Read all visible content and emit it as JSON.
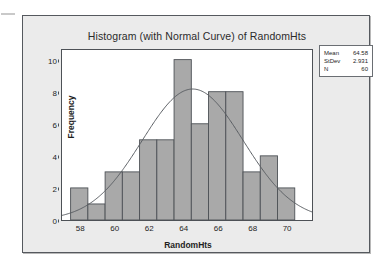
{
  "chart_data": {
    "type": "bar",
    "title": "Histogram (with Normal Curve) of RandomHts",
    "xlabel": "RandomHts",
    "ylabel": "Frequency",
    "grid": false,
    "xlim": [
      57.0,
      71.5
    ],
    "ylim": [
      0,
      10.6
    ],
    "xticks": [
      58,
      60,
      62,
      64,
      66,
      68,
      70
    ],
    "yticks": [
      0,
      2,
      4,
      6,
      8,
      10
    ],
    "bin_width": 1.0,
    "bin_edges": [
      57.5,
      58.5,
      59.5,
      60.5,
      61.5,
      62.5,
      63.5,
      64.5,
      65.5,
      66.5,
      67.5,
      68.5,
      69.5,
      70.5
    ],
    "bin_centers": [
      58,
      59,
      60,
      61,
      62,
      63,
      64,
      65,
      66,
      67,
      68,
      69,
      70
    ],
    "values": [
      2,
      1,
      3,
      3,
      5,
      5,
      10,
      6,
      8,
      8,
      3,
      4,
      2
    ],
    "categories": [
      "58",
      "59",
      "60",
      "61",
      "62",
      "63",
      "64",
      "65",
      "66",
      "67",
      "68",
      "69",
      "70"
    ],
    "bar_fill_color": "#a9a9a9",
    "bar_edge_color": "#4d5156",
    "overlay": {
      "type": "line",
      "name": "Normal Curve",
      "mean": 64.58,
      "stdev": 2.931,
      "n": 60,
      "scale_bin_width": 1.0,
      "peak_value": 8.17,
      "color": "#5a5e63"
    }
  },
  "stats_box": {
    "rows": [
      {
        "key": "Mean",
        "value": "64.58"
      },
      {
        "key": "StDev",
        "value": "2.931"
      },
      {
        "key": "N",
        "value": "60"
      }
    ]
  },
  "axis": {
    "y_tick_labels": [
      "0",
      "2",
      "4",
      "6",
      "8",
      "10"
    ],
    "x_tick_labels": [
      "58",
      "60",
      "62",
      "64",
      "66",
      "68",
      "70"
    ]
  }
}
